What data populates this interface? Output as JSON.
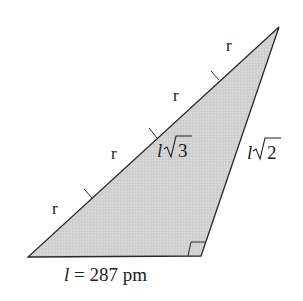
{
  "diagram": {
    "type": "right-triangle",
    "fill_color": "#d0d0d0",
    "stroke_color": "#2a2a2a",
    "vertices": {
      "bottom_left": [
        28,
        257
      ],
      "right_angle": [
        201,
        256
      ],
      "top": [
        279,
        27
      ]
    },
    "sides": {
      "base": {
        "label_var": "l",
        "label_rest": " = 287 pm"
      },
      "hypotenuse": {
        "label_var": "l",
        "label_root": "3",
        "segments": 4,
        "segment_label": "r"
      },
      "leg": {
        "label_var": "l",
        "label_root": "2"
      }
    },
    "segment_labels": [
      "r",
      "r",
      "r",
      "r"
    ]
  }
}
